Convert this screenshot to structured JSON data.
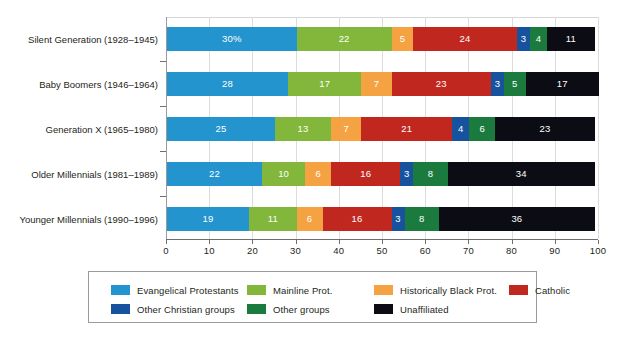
{
  "chart_data": {
    "type": "bar",
    "orientation": "horizontal",
    "stacked": true,
    "title": "",
    "subtitle": "",
    "xlabel": "",
    "ylabel": "",
    "xlim": [
      0,
      100
    ],
    "xticks": [
      "0",
      "10",
      "20",
      "30",
      "40",
      "50",
      "60",
      "70",
      "80",
      "90",
      "100"
    ],
    "grid": true,
    "legend_position": "bottom",
    "categories": [
      "Silent Generation (1928–1945)",
      "Baby Boomers (1946–1964)",
      "Generation X (1965–1980)",
      "Older Millennials (1981–1989)",
      "Younger Millennials (1990–1996)"
    ],
    "series": [
      {
        "name": "Evangelical Protestants",
        "color": "#2494ce",
        "values": [
          30,
          28,
          25,
          22,
          19
        ],
        "labels": [
          "30%",
          "28",
          "25",
          "22",
          "19"
        ]
      },
      {
        "name": "Mainline Prot.",
        "color": "#82b73c",
        "values": [
          22,
          17,
          13,
          10,
          11
        ],
        "labels": [
          "22",
          "17",
          "13",
          "10",
          "11"
        ]
      },
      {
        "name": "Historically Black Prot.",
        "color": "#f5a342",
        "values": [
          5,
          7,
          7,
          6,
          6
        ],
        "labels": [
          "5",
          "7",
          "7",
          "6",
          "6"
        ]
      },
      {
        "name": "Catholic",
        "color": "#c0281f",
        "values": [
          24,
          23,
          21,
          16,
          16
        ],
        "labels": [
          "24",
          "23",
          "21",
          "16",
          "16"
        ]
      },
      {
        "name": "Other Christian groups",
        "color": "#17529e",
        "values": [
          3,
          3,
          4,
          3,
          3
        ],
        "labels": [
          "3",
          "3",
          "4",
          "3",
          "3"
        ]
      },
      {
        "name": "Other groups",
        "color": "#1b7a3d",
        "values": [
          4,
          5,
          6,
          8,
          8
        ],
        "labels": [
          "4",
          "5",
          "6",
          "8",
          "8"
        ]
      },
      {
        "name": "Unaffiliated",
        "color": "#0b0c14",
        "values": [
          11,
          17,
          23,
          34,
          36
        ],
        "labels": [
          "11",
          "17",
          "23",
          "34",
          "36"
        ]
      }
    ]
  },
  "legend": {
    "items": [
      {
        "label": "Evangelical Protestants",
        "color": "#2494ce"
      },
      {
        "label": "Mainline Prot.",
        "color": "#82b73c"
      },
      {
        "label": "Historically Black Prot.",
        "color": "#f5a342"
      },
      {
        "label": "Catholic",
        "color": "#c0281f"
      },
      {
        "label": "Other Christian groups",
        "color": "#17529e"
      },
      {
        "label": "Other groups",
        "color": "#1b7a3d"
      },
      {
        "label": "Unaffiliated",
        "color": "#0b0c14"
      }
    ]
  },
  "axis": {
    "x_tick_labels": [
      "0",
      "10",
      "20",
      "30",
      "40",
      "50",
      "60",
      "70",
      "80",
      "90",
      "100"
    ]
  }
}
